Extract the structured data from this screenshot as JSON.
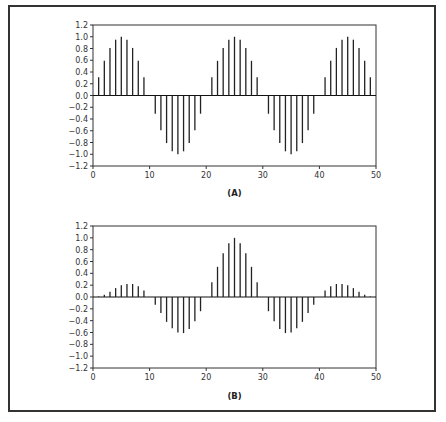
{
  "chart_data": [
    {
      "type": "bar",
      "subtype": "stem",
      "title": "",
      "caption": "(A)",
      "xlabel": "",
      "ylabel": "",
      "xlim": [
        0,
        50
      ],
      "ylim": [
        -1.2,
        1.2
      ],
      "x_ticks": [
        "0",
        "10",
        "20",
        "30",
        "40",
        "50"
      ],
      "y_ticks": [
        "1.2",
        "1.0",
        "0.8",
        "0.6",
        "0.4",
        "0.2",
        "0.0",
        "-0.2",
        "-0.4",
        "-0.6",
        "-0.8",
        "-1.0",
        "-1.2"
      ],
      "grid": false,
      "legend": null,
      "x": [
        0,
        1,
        2,
        3,
        4,
        5,
        6,
        7,
        8,
        9,
        10,
        11,
        12,
        13,
        14,
        15,
        16,
        17,
        18,
        19,
        20,
        21,
        22,
        23,
        24,
        25,
        26,
        27,
        28,
        29,
        30,
        31,
        32,
        33,
        34,
        35,
        36,
        37,
        38,
        39,
        40,
        41,
        42,
        43,
        44,
        45,
        46,
        47,
        48,
        49
      ],
      "values": [
        0,
        0.31,
        0.59,
        0.81,
        0.95,
        1.0,
        0.95,
        0.81,
        0.59,
        0.31,
        0,
        -0.31,
        -0.59,
        -0.81,
        -0.95,
        -1.0,
        -0.95,
        -0.81,
        -0.59,
        -0.31,
        0,
        0.31,
        0.59,
        0.81,
        0.95,
        1.0,
        0.95,
        0.81,
        0.59,
        0.31,
        0,
        -0.31,
        -0.59,
        -0.81,
        -0.95,
        -1.0,
        -0.95,
        -0.81,
        -0.59,
        -0.31,
        0,
        0.31,
        0.59,
        0.81,
        0.95,
        1.0,
        0.95,
        0.81,
        0.59,
        0.31
      ]
    },
    {
      "type": "bar",
      "subtype": "stem",
      "title": "",
      "caption": "(B)",
      "xlabel": "",
      "ylabel": "",
      "xlim": [
        0,
        50
      ],
      "ylim": [
        -1.2,
        1.2
      ],
      "x_ticks": [
        "0",
        "10",
        "20",
        "30",
        "40",
        "50"
      ],
      "y_ticks": [
        "1.2",
        "1.0",
        "0.8",
        "0.6",
        "0.4",
        "0.2",
        "0.0",
        "-0.2",
        "-0.4",
        "-0.6",
        "-0.8",
        "-1.0",
        "-1.2"
      ],
      "grid": false,
      "legend": null,
      "x": [
        0,
        1,
        2,
        3,
        4,
        5,
        6,
        7,
        8,
        9,
        10,
        11,
        12,
        13,
        14,
        15,
        16,
        17,
        18,
        19,
        20,
        21,
        22,
        23,
        24,
        25,
        26,
        27,
        28,
        29,
        30,
        31,
        32,
        33,
        34,
        35,
        36,
        37,
        38,
        39,
        40,
        41,
        42,
        43,
        44,
        45,
        46,
        47,
        48,
        49
      ],
      "values": [
        0,
        0.01,
        0.04,
        0.09,
        0.15,
        0.2,
        0.22,
        0.22,
        0.18,
        0.11,
        0,
        -0.13,
        -0.27,
        -0.42,
        -0.53,
        -0.6,
        -0.61,
        -0.54,
        -0.41,
        -0.24,
        0,
        0.25,
        0.51,
        0.74,
        0.91,
        1.0,
        0.91,
        0.74,
        0.51,
        0.25,
        0,
        -0.24,
        -0.41,
        -0.54,
        -0.61,
        -0.6,
        -0.53,
        -0.42,
        -0.27,
        -0.13,
        0,
        0.11,
        0.18,
        0.22,
        0.22,
        0.2,
        0.15,
        0.09,
        0.04,
        0.01
      ]
    }
  ],
  "style": {
    "stem_color": "#222222",
    "axis_color": "#333333"
  }
}
